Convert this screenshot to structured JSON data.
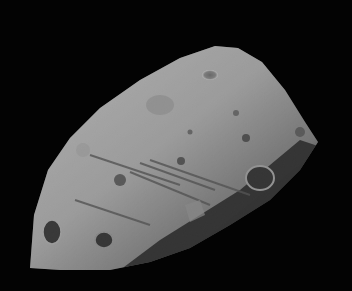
{
  "image": {
    "subject": "Irregular cratered moon (Phobos-like) against black space",
    "background_color": "#030303",
    "surface_light": "#bdbdbd",
    "surface_mid": "#8a8a8a",
    "surface_dark": "#2a2a2a"
  }
}
